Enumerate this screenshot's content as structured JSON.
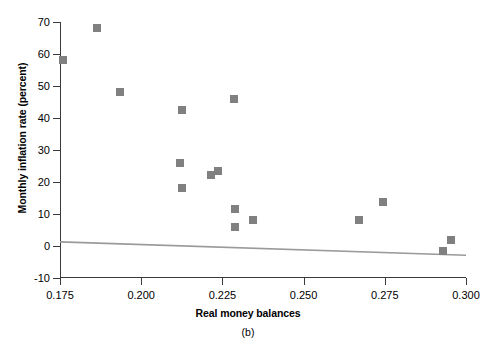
{
  "chart_data": {
    "type": "scatter",
    "title": "",
    "panel_label": "(b)",
    "xlabel": "Real money balances",
    "ylabel": "Monthly inflation rate (percent)",
    "xlim": [
      0.175,
      0.3
    ],
    "ylim": [
      -10,
      70
    ],
    "xticks": [
      0.175,
      0.2,
      0.225,
      0.25,
      0.275,
      0.3
    ],
    "xtick_labels": [
      "0.175",
      "0.200",
      "0.225",
      "0.250",
      "0.275",
      "0.300"
    ],
    "yticks": [
      -10,
      0,
      10,
      20,
      30,
      40,
      50,
      60,
      70
    ],
    "ytick_labels": [
      "-10",
      "0",
      "10",
      "20",
      "30",
      "40",
      "50",
      "60",
      "70"
    ],
    "grid": false,
    "legend": null,
    "marker_color": "#808080",
    "marker_shape": "square",
    "line_color": "#9a9a9a",
    "points": [
      {
        "x": 0.176,
        "y": 58.0
      },
      {
        "x": 0.1865,
        "y": 68.0
      },
      {
        "x": 0.1935,
        "y": 48.0
      },
      {
        "x": 0.2125,
        "y": 42.5
      },
      {
        "x": 0.2285,
        "y": 45.8
      },
      {
        "x": 0.212,
        "y": 26.0
      },
      {
        "x": 0.2125,
        "y": 18.0
      },
      {
        "x": 0.2215,
        "y": 22.2
      },
      {
        "x": 0.2235,
        "y": 23.4
      },
      {
        "x": 0.229,
        "y": 11.5
      },
      {
        "x": 0.229,
        "y": 6.0
      },
      {
        "x": 0.2345,
        "y": 8.0
      },
      {
        "x": 0.267,
        "y": 8.0
      },
      {
        "x": 0.2745,
        "y": 13.7
      },
      {
        "x": 0.293,
        "y": -1.5
      },
      {
        "x": 0.2955,
        "y": 2.0
      }
    ],
    "fit_line": {
      "x0": 0.175,
      "y0": 1.3,
      "x1": 0.3,
      "y1": -2.9
    },
    "zero_reference_line": true
  }
}
